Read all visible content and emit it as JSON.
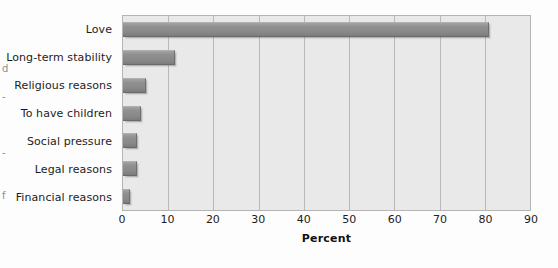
{
  "margin_scraps": {
    "items": [
      "d",
      "-",
      "-",
      "f"
    ]
  },
  "chart_data": {
    "type": "bar",
    "orientation": "horizontal",
    "title": "",
    "xlabel": "Percent",
    "ylabel": "",
    "categories": [
      "Love",
      "Long-term stability",
      "Religious reasons",
      "To have children",
      "Social pressure",
      "Legal reasons",
      "Financial reasons"
    ],
    "values": [
      81,
      11.5,
      5,
      4,
      3,
      3,
      1.5
    ],
    "xlim": [
      0,
      90
    ],
    "xticks": [
      0,
      10,
      20,
      30,
      40,
      50,
      60,
      70,
      80,
      90
    ],
    "xtick_labels": [
      "0",
      "10",
      "20",
      "30",
      "40",
      "50",
      "60",
      "70",
      "80",
      "90"
    ],
    "grid": "vertical",
    "legend": "none",
    "colors": {
      "bar": "#8a8a8a",
      "plot_background": "#e9e9e9",
      "gridline": "#b9b9b9",
      "plot_border": "#b4b4b4",
      "page_background": "#fdfdfd",
      "text": "#1c1c1c"
    }
  }
}
